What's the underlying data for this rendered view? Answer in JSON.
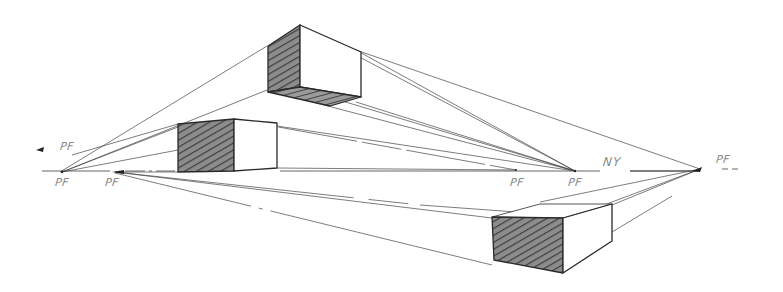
{
  "figure": {
    "colors": {
      "background": "#ffffff",
      "line": "#3a3a3a",
      "label": "#8a8a8a",
      "hatching": "#4a4a4a"
    }
  },
  "labels": {
    "pf_far_left": "PF",
    "pf_left_horizon": "PF",
    "pf_left_inner": "PF",
    "pf_center_left": "PF",
    "pf_center": "PF",
    "horizon": "NY",
    "pf_right": "PF"
  },
  "boxes": [
    {
      "name": "top-box",
      "position": "above horizon"
    },
    {
      "name": "middle-box",
      "position": "on horizon"
    },
    {
      "name": "bottom-box",
      "position": "below horizon"
    }
  ]
}
